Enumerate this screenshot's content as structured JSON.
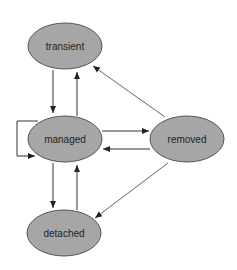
{
  "diagram": {
    "type": "state-diagram",
    "colors": {
      "node_fill": "#a6a6a6",
      "node_stroke": "#555555",
      "edge": "#333333",
      "edge_light": "#666666",
      "text": "#222222",
      "background": "#ffffff"
    },
    "nodes": [
      {
        "id": "transient",
        "label": "transient",
        "cx": 65,
        "cy": 46,
        "rx": 37,
        "ry": 23
      },
      {
        "id": "managed",
        "label": "managed",
        "cx": 65,
        "cy": 139,
        "rx": 37,
        "ry": 23
      },
      {
        "id": "removed",
        "label": "removed",
        "cx": 187,
        "cy": 139,
        "rx": 37,
        "ry": 23
      },
      {
        "id": "detached",
        "label": "detached",
        "cx": 64,
        "cy": 233,
        "rx": 37,
        "ry": 23
      }
    ],
    "edges": [
      {
        "from": "transient",
        "to": "managed"
      },
      {
        "from": "managed",
        "to": "transient"
      },
      {
        "from": "removed",
        "to": "transient"
      },
      {
        "from": "managed",
        "to": "removed"
      },
      {
        "from": "removed",
        "to": "managed"
      },
      {
        "from": "managed",
        "to": "managed"
      },
      {
        "from": "managed",
        "to": "detached"
      },
      {
        "from": "detached",
        "to": "managed"
      },
      {
        "from": "removed",
        "to": "detached"
      }
    ]
  }
}
